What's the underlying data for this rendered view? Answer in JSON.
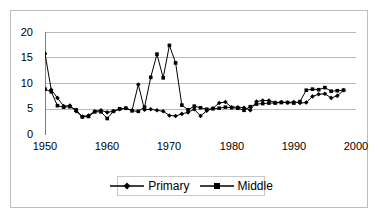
{
  "top_remnant": "",
  "chart_data": {
    "type": "line",
    "title": "",
    "xlabel": "",
    "ylabel": "",
    "xlim": [
      1950,
      2000
    ],
    "ylim": [
      0,
      20
    ],
    "xticks": [
      1950,
      1960,
      1970,
      1980,
      1990,
      2000
    ],
    "yticks": [
      0,
      5,
      10,
      15,
      20
    ],
    "grid": "horizontal",
    "legend_position": "bottom",
    "x": [
      1950,
      1951,
      1952,
      1953,
      1954,
      1955,
      1956,
      1957,
      1958,
      1959,
      1960,
      1961,
      1962,
      1963,
      1964,
      1965,
      1966,
      1967,
      1968,
      1969,
      1970,
      1971,
      1972,
      1973,
      1974,
      1975,
      1976,
      1977,
      1978,
      1979,
      1980,
      1981,
      1982,
      1983,
      1984,
      1985,
      1986,
      1987,
      1988,
      1989,
      1990,
      1991,
      1992,
      1993,
      1994,
      1995,
      1996,
      1997,
      1998
    ],
    "series": [
      {
        "name": "Primary",
        "marker": "diamond",
        "color": "#000000",
        "values": [
          15.8,
          8.8,
          7.2,
          5.6,
          5.7,
          4.6,
          3.6,
          3.8,
          4.6,
          4.8,
          4.4,
          4.6,
          5.0,
          5.2,
          4.8,
          9.8,
          4.9,
          5.0,
          4.8,
          4.6,
          3.8,
          3.7,
          4.1,
          4.4,
          5.0,
          3.7,
          4.7,
          5.2,
          6.2,
          6.4,
          5.4,
          5.4,
          5.3,
          4.8,
          6.5,
          6.7,
          6.7,
          6.3,
          6.4,
          6.3,
          6.4,
          6.2,
          6.3,
          7.5,
          7.9,
          8.0,
          7.2,
          7.6,
          8.7
        ]
      },
      {
        "name": "Middle",
        "marker": "square",
        "color": "#000000",
        "values": [
          8.9,
          8.4,
          5.7,
          5.4,
          5.5,
          4.9,
          3.5,
          3.6,
          4.5,
          4.5,
          3.2,
          4.6,
          5.1,
          5.2,
          4.7,
          4.6,
          5.4,
          11.2,
          15.7,
          11.1,
          17.4,
          14.0,
          5.8,
          4.9,
          5.6,
          5.3,
          5.0,
          5.1,
          5.2,
          5.4,
          5.3,
          5.2,
          4.8,
          5.5,
          6.0,
          6.1,
          6.2,
          6.2,
          6.3,
          6.3,
          6.2,
          6.5,
          8.7,
          8.9,
          8.8,
          9.2,
          8.5,
          8.6,
          8.7
        ]
      }
    ]
  },
  "legend": {
    "items": [
      {
        "label": "Primary"
      },
      {
        "label": "Middle"
      }
    ]
  }
}
